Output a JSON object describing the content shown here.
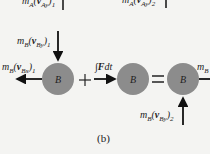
{
  "figure_label": "(b)",
  "body_label": "B",
  "top_labels": {
    "left": "m_A(v_Ay)_1",
    "right": "m_A(v_Ay)_2"
  },
  "labels": {
    "mB_vBy1": "m_B(v_By)_1",
    "mB_vBx1": "m_B(v_Bx)_1",
    "impulse": "∫Fdt",
    "mB_right": "m_B",
    "mB_vBy2": "m_B(v_By)_2"
  },
  "operators": {
    "plus": "+",
    "equals": "="
  },
  "colors": {
    "circle": "#8c8c8c",
    "arrow": "#111111",
    "background": "#f4f4f2"
  }
}
